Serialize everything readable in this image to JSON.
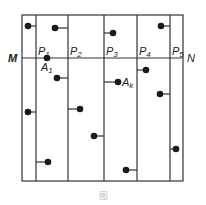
{
  "diagram": {
    "type": "strip-partition-with-points",
    "frame": {
      "x1": 22,
      "y1": 15,
      "x2": 183,
      "y2": 181
    },
    "line_color": "#333333",
    "dot_color": "#1a1a1a",
    "horizontal_line": {
      "y": 58,
      "left_label": "M",
      "right_label": "N"
    },
    "vertical_lines": [
      {
        "x": 36,
        "label": "P1",
        "label_main": "P",
        "label_sub": "1"
      },
      {
        "x": 68,
        "label": "P2",
        "label_main": "P",
        "label_sub": "2"
      },
      {
        "x": 104,
        "label": "P3",
        "label_main": "P",
        "label_sub": "3"
      },
      {
        "x": 137,
        "label": "P4",
        "label_main": "P",
        "label_sub": "4"
      },
      {
        "x": 170,
        "label": "P5",
        "label_main": "P",
        "label_sub": "5"
      }
    ],
    "points": [
      {
        "x": 28,
        "y": 26,
        "tick_to": 36,
        "label": ""
      },
      {
        "x": 55,
        "y": 28,
        "tick_to": 68,
        "label": ""
      },
      {
        "x": 113,
        "y": 33,
        "tick_to": 104,
        "label": ""
      },
      {
        "x": 161,
        "y": 26,
        "tick_to": 170,
        "label": ""
      },
      {
        "x": 47,
        "y": 58,
        "tick_to": null,
        "label": "A1",
        "label_main": "A",
        "label_sub": "1"
      },
      {
        "x": 57,
        "y": 78,
        "tick_to": 68,
        "label": ""
      },
      {
        "x": 118,
        "y": 82,
        "tick_to": 104,
        "label": "Ak",
        "label_main": "A",
        "label_sub": "k"
      },
      {
        "x": 146,
        "y": 70,
        "tick_to": 137,
        "label": ""
      },
      {
        "x": 160,
        "y": 94,
        "tick_to": 170,
        "label": ""
      },
      {
        "x": 28,
        "y": 112,
        "tick_to": 36,
        "label": ""
      },
      {
        "x": 80,
        "y": 109,
        "tick_to": 68,
        "label": ""
      },
      {
        "x": 94,
        "y": 136,
        "tick_to": 104,
        "label": ""
      },
      {
        "x": 48,
        "y": 162,
        "tick_to": 36,
        "label": ""
      },
      {
        "x": 126,
        "y": 170,
        "tick_to": 137,
        "label": ""
      },
      {
        "x": 176,
        "y": 149,
        "tick_to": 170,
        "label": ""
      }
    ],
    "caption": "图"
  }
}
